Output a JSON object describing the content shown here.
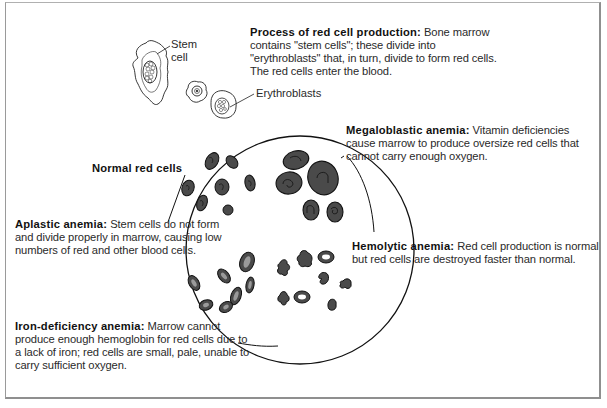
{
  "diagram": {
    "type": "educational-illustration",
    "topic": "Anemia types and red cell production",
    "colors": {
      "cell_fill": "#4a4a4a",
      "cell_outline": "#111111",
      "pale_cell_center": "#9a9a9a",
      "line": "#111111",
      "frame": "#9a9a9a"
    }
  },
  "labels": {
    "stem_cell_line1": "Stem",
    "stem_cell_line2": "cell",
    "erythroblasts": "Erythroblasts"
  },
  "sections": {
    "production": {
      "title": "Process of red cell production:",
      "body": " Bone marrow contains \"stem cells\"; these divide into \"erythroblasts\" that, in turn, divide to form red cells. The red cells enter the blood."
    },
    "normal": {
      "title": "Normal red cells"
    },
    "megaloblastic": {
      "title": "Megaloblastic anemia:",
      "body": " Vitamin deficiencies cause marrow to produce oversize red cells that cannot carry enough oxygen."
    },
    "aplastic": {
      "title": "Aplastic anemia:",
      "body": " Stem cells do not form and divide properly in marrow, causing low numbers of red and other blood cells."
    },
    "hemolytic": {
      "title": "Hemolytic anemia:",
      "body": " Red cell production is normal but red cells are destroyed faster than normal."
    },
    "iron_deficiency": {
      "title": "Iron-deficiency anemia:",
      "body": " Marrow cannot produce enough hemoglobin for red cells due to a lack of iron; red cells are small, pale, unable to carry sufficient oxygen."
    }
  }
}
